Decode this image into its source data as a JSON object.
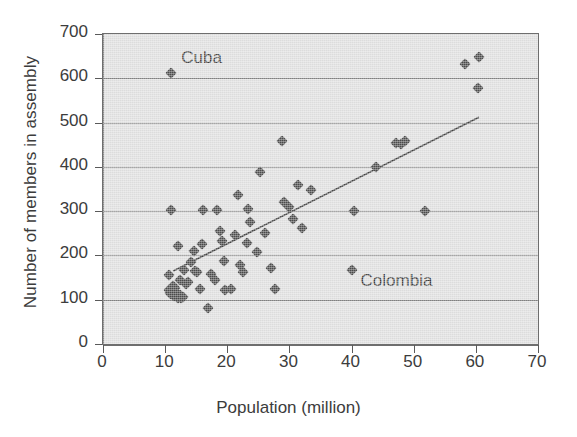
{
  "chart_data": {
    "type": "scatter",
    "title": "",
    "xlabel": "Population (million)",
    "ylabel": "Number of members in assembly",
    "xlim": [
      0,
      70
    ],
    "ylim": [
      0,
      700
    ],
    "xticks": [
      0,
      10,
      20,
      30,
      40,
      50,
      60,
      70
    ],
    "yticks": [
      0,
      100,
      200,
      300,
      400,
      500,
      600,
      700
    ],
    "grid": "horizontal",
    "legend": "none",
    "marker": "diamond",
    "marker_color": "#4a4a4a",
    "plot_background": "#dcdcdc",
    "axis_color": "#6e6e6e",
    "points": [
      {
        "x": 10.6,
        "y": 122
      },
      {
        "x": 10.8,
        "y": 116
      },
      {
        "x": 11.0,
        "y": 113
      },
      {
        "x": 11.2,
        "y": 130
      },
      {
        "x": 11.3,
        "y": 118
      },
      {
        "x": 11.5,
        "y": 108
      },
      {
        "x": 11.6,
        "y": 126
      },
      {
        "x": 11.9,
        "y": 112
      },
      {
        "x": 12.1,
        "y": 104
      },
      {
        "x": 12.4,
        "y": 110
      },
      {
        "x": 12.6,
        "y": 103
      },
      {
        "x": 12.9,
        "y": 106
      },
      {
        "x": 10.6,
        "y": 155
      },
      {
        "x": 10.9,
        "y": 303
      },
      {
        "x": 12.1,
        "y": 221
      },
      {
        "x": 12.4,
        "y": 145
      },
      {
        "x": 13.1,
        "y": 167
      },
      {
        "x": 13.4,
        "y": 135
      },
      {
        "x": 13.6,
        "y": 140
      },
      {
        "x": 14.2,
        "y": 185
      },
      {
        "x": 14.6,
        "y": 210
      },
      {
        "x": 14.8,
        "y": 165
      },
      {
        "x": 15.2,
        "y": 163
      },
      {
        "x": 15.6,
        "y": 124
      },
      {
        "x": 16.0,
        "y": 225
      },
      {
        "x": 16.1,
        "y": 303
      },
      {
        "x": 16.9,
        "y": 82
      },
      {
        "x": 17.3,
        "y": 158
      },
      {
        "x": 18.0,
        "y": 144
      },
      {
        "x": 18.4,
        "y": 303
      },
      {
        "x": 18.8,
        "y": 255
      },
      {
        "x": 19.1,
        "y": 232
      },
      {
        "x": 19.4,
        "y": 188
      },
      {
        "x": 19.6,
        "y": 122
      },
      {
        "x": 20.6,
        "y": 124
      },
      {
        "x": 21.2,
        "y": 247
      },
      {
        "x": 21.7,
        "y": 336
      },
      {
        "x": 22.0,
        "y": 178
      },
      {
        "x": 22.6,
        "y": 163
      },
      {
        "x": 23.1,
        "y": 228
      },
      {
        "x": 23.3,
        "y": 305
      },
      {
        "x": 23.6,
        "y": 276
      },
      {
        "x": 24.8,
        "y": 208
      },
      {
        "x": 25.3,
        "y": 388
      },
      {
        "x": 26.1,
        "y": 250
      },
      {
        "x": 27.1,
        "y": 172
      },
      {
        "x": 27.6,
        "y": 124
      },
      {
        "x": 28.8,
        "y": 459
      },
      {
        "x": 29.1,
        "y": 320
      },
      {
        "x": 29.9,
        "y": 310
      },
      {
        "x": 30.6,
        "y": 283
      },
      {
        "x": 31.3,
        "y": 360
      },
      {
        "x": 32.0,
        "y": 262
      },
      {
        "x": 33.4,
        "y": 348
      },
      {
        "x": 40.0,
        "y": 168
      },
      {
        "x": 40.4,
        "y": 300
      },
      {
        "x": 44.0,
        "y": 400
      },
      {
        "x": 47.2,
        "y": 455
      },
      {
        "x": 47.9,
        "y": 452
      },
      {
        "x": 48.6,
        "y": 458
      },
      {
        "x": 51.8,
        "y": 300
      },
      {
        "x": 58.2,
        "y": 633
      },
      {
        "x": 60.5,
        "y": 648
      },
      {
        "x": 60.3,
        "y": 578
      },
      {
        "x": 11.0,
        "y": 613
      }
    ],
    "trendline": {
      "x1": 11.3,
      "y1": 165,
      "x2": 60.5,
      "y2": 512,
      "color": "#3f3f3f"
    },
    "annotations": [
      {
        "label": "Cuba",
        "x": 11.0,
        "y": 613,
        "dx": 10,
        "dy": -14
      },
      {
        "label": "Colombia",
        "x": 40.0,
        "y": 168,
        "dx": 9,
        "dy": 12
      }
    ]
  }
}
